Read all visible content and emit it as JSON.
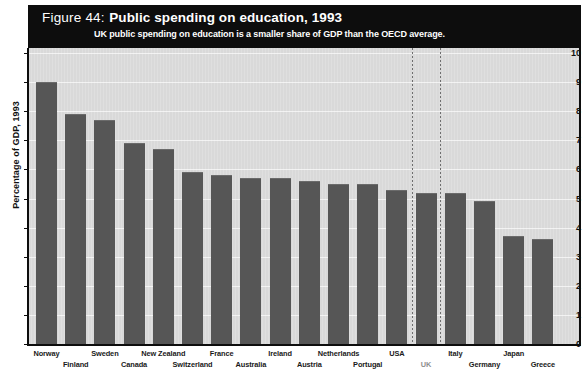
{
  "header": {
    "figure_number": "Figure 44:",
    "title": "Public spending on education, 1993",
    "subtitle": "UK public spending on education is a smaller share of GDP than the OECD average."
  },
  "axis": {
    "y_title": "Percentage of GDP, 1993",
    "y_ticks": [
      "10",
      "9",
      "8",
      "7",
      "6",
      "5",
      "4",
      "3",
      "2",
      "1",
      "0"
    ]
  },
  "colors": {
    "header_band": "#0d0d0d",
    "plot_background": "#d9d9d9",
    "bar": "#565656",
    "gridline": "#f2f2f2",
    "highlight_label": "#8f8f8f"
  },
  "chart_data": {
    "type": "bar",
    "title": "Public spending on education, 1993",
    "subtitle": "UK public spending on education is a smaller share of GDP than the OECD average.",
    "xlabel": "",
    "ylabel": "Percentage of GDP, 1993",
    "ylim": [
      0,
      10
    ],
    "yticks": [
      0,
      1,
      2,
      3,
      4,
      5,
      6,
      7,
      8,
      9,
      10
    ],
    "grid": true,
    "legend": "none",
    "highlight": "UK",
    "annotations": [
      "dotted vertical lines bracketing the UK bar"
    ],
    "categories": [
      "Norway",
      "Finland",
      "Sweden",
      "Canada",
      "New Zealand",
      "Switzerland",
      "France",
      "Australia",
      "Ireland",
      "Austria",
      "Netherlands",
      "Portugal",
      "USA",
      "UK",
      "Italy",
      "Germany",
      "Japan",
      "Greece"
    ],
    "values": [
      9.0,
      7.9,
      7.7,
      6.9,
      6.7,
      5.9,
      5.8,
      5.7,
      5.7,
      5.6,
      5.5,
      5.5,
      5.3,
      5.2,
      5.2,
      4.9,
      3.7,
      3.6
    ]
  }
}
